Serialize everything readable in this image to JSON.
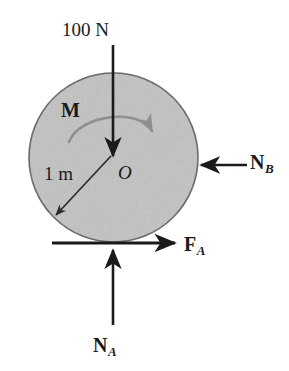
{
  "figure": {
    "kind": "free-body-diagram",
    "background_color": "#ffffff"
  },
  "body": {
    "shape": "circle",
    "name": "cylinder",
    "fill_color": "#c2c2c2",
    "stroke_color": "#4d4d4d",
    "center": {
      "x": 113,
      "y": 158,
      "label": "O"
    },
    "radius_px": 85
  },
  "labels": {
    "applied_load": "100 N",
    "moment": "M",
    "radius": "1 m",
    "center": "O",
    "reaction_b": {
      "symbol": "N",
      "subscript": "B"
    },
    "friction_a": {
      "symbol": "F",
      "subscript": "A"
    },
    "reaction_a": {
      "symbol": "N",
      "subscript": "A"
    }
  },
  "forces": [
    {
      "id": "applied-load",
      "label": "100 N",
      "direction": "down",
      "from": {
        "x": 113,
        "y": 45
      },
      "to": {
        "x": 113,
        "y": 158
      },
      "color": "#1a1a1a"
    },
    {
      "id": "reaction-b",
      "label": "N_B",
      "direction": "left",
      "from": {
        "x": 247,
        "y": 165
      },
      "to": {
        "x": 199,
        "y": 165
      },
      "color": "#1a1a1a"
    },
    {
      "id": "friction-a",
      "label": "F_A",
      "direction": "right",
      "from": {
        "x": 52,
        "y": 243
      },
      "to": {
        "x": 177,
        "y": 243
      },
      "color": "#1a1a1a"
    },
    {
      "id": "reaction-a",
      "label": "N_A",
      "direction": "up",
      "from": {
        "x": 113,
        "y": 325
      },
      "to": {
        "x": 113,
        "y": 248
      },
      "color": "#1a1a1a"
    }
  ],
  "moment": {
    "id": "couple-moment",
    "label": "M",
    "sense": "clockwise",
    "color": "#8c8c8c",
    "arc_start": {
      "x": 70,
      "y": 141
    },
    "arc_end": {
      "x": 152,
      "y": 133
    }
  },
  "dimension": {
    "id": "radius-dimension",
    "label": "1 m",
    "from": {
      "x": 111,
      "y": 156
    },
    "to": {
      "x": 55,
      "y": 216
    },
    "color": "#1a1a1a"
  },
  "ground": {
    "id": "ground-line",
    "y": 243,
    "x_start": 52,
    "x_end": 177,
    "color": "#1a1a1a"
  }
}
